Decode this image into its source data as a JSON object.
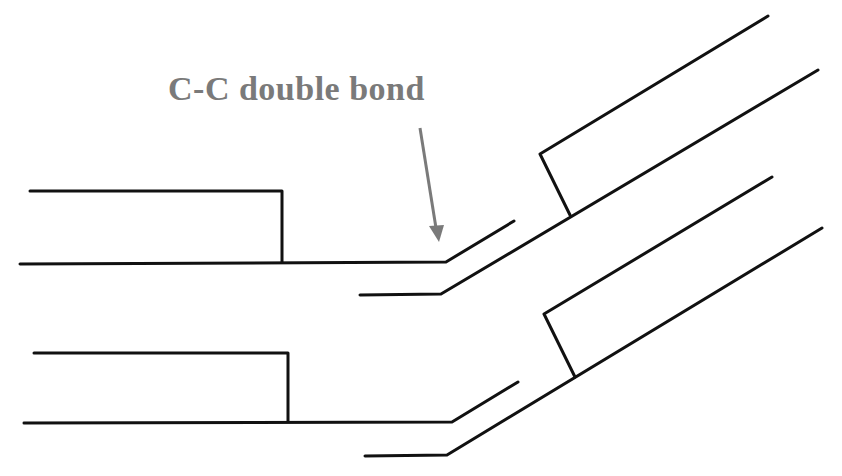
{
  "diagram": {
    "title": "C-C double bond",
    "annotation": {
      "text": "C-C double bond",
      "color": "#7a7a7a",
      "arrow_target": "double bond kink in upper chain pair"
    },
    "colors": {
      "lines": "#111111",
      "annotation": "#7a7a7a",
      "background": "#ffffff"
    },
    "elements": [
      {
        "name": "upper-lipid-pair",
        "description": "two hydrocarbon chains with a kink at the C-C double bond"
      },
      {
        "name": "lower-lipid-pair",
        "description": "two hydrocarbon chains with a kink at the C-C double bond"
      }
    ]
  }
}
